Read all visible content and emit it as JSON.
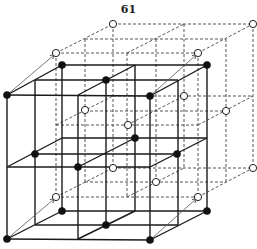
{
  "page": {
    "number": "61"
  },
  "diagram": {
    "colors": {
      "line": "#1a1a1a",
      "dashed": "#444444",
      "filled_atom": "#111111",
      "open_atom": "#ffffff"
    },
    "solid_lines": [
      [
        7,
        95,
        150,
        96
      ],
      [
        7,
        167,
        150,
        167
      ],
      [
        7,
        239,
        150,
        240
      ],
      [
        7,
        95,
        7,
        239
      ],
      [
        78,
        95,
        78,
        239
      ],
      [
        150,
        96,
        150,
        240
      ],
      [
        62,
        65,
        207,
        65
      ],
      [
        62,
        138,
        207,
        138
      ],
      [
        62,
        211,
        207,
        211
      ],
      [
        62,
        65,
        62,
        211
      ],
      [
        135,
        65,
        135,
        211
      ],
      [
        207,
        65,
        207,
        211
      ],
      [
        35,
        80,
        178,
        80
      ],
      [
        35,
        154,
        178,
        154
      ],
      [
        35,
        225,
        178,
        225
      ],
      [
        35,
        80,
        35,
        225
      ],
      [
        106,
        80,
        106,
        225
      ],
      [
        178,
        80,
        178,
        225
      ],
      [
        7,
        95,
        62,
        65
      ],
      [
        78,
        95,
        135,
        65
      ],
      [
        150,
        96,
        207,
        65
      ],
      [
        7,
        167,
        62,
        138
      ],
      [
        78,
        167,
        135,
        138
      ],
      [
        150,
        167,
        207,
        138
      ],
      [
        7,
        239,
        62,
        211
      ],
      [
        78,
        239,
        135,
        211
      ],
      [
        150,
        240,
        207,
        211
      ]
    ],
    "dashed_lines": [
      [
        56,
        53,
        198,
        53
      ],
      [
        56,
        125,
        198,
        125
      ],
      [
        56,
        197,
        198,
        197
      ],
      [
        56,
        53,
        56,
        197
      ],
      [
        127,
        53,
        127,
        197
      ],
      [
        198,
        53,
        198,
        197
      ],
      [
        113,
        24,
        253,
        24
      ],
      [
        113,
        96,
        253,
        96
      ],
      [
        113,
        168,
        253,
        168
      ],
      [
        113,
        24,
        113,
        168
      ],
      [
        184,
        24,
        184,
        168
      ],
      [
        253,
        24,
        253,
        168
      ],
      [
        85,
        39,
        226,
        39
      ],
      [
        85,
        111,
        226,
        111
      ],
      [
        85,
        182,
        226,
        182
      ],
      [
        85,
        39,
        85,
        182
      ],
      [
        156,
        39,
        156,
        182
      ],
      [
        226,
        39,
        226,
        182
      ],
      [
        56,
        53,
        113,
        24
      ],
      [
        127,
        53,
        184,
        24
      ],
      [
        198,
        53,
        253,
        24
      ],
      [
        56,
        125,
        113,
        96
      ],
      [
        127,
        125,
        184,
        96
      ],
      [
        198,
        125,
        253,
        96
      ],
      [
        56,
        197,
        113,
        168
      ],
      [
        127,
        197,
        184,
        168
      ],
      [
        198,
        197,
        253,
        168
      ]
    ],
    "arrows": [
      [
        7,
        95,
        54,
        55
      ],
      [
        150,
        96,
        196,
        55
      ],
      [
        7,
        239,
        54,
        199
      ],
      [
        150,
        240,
        196,
        199
      ]
    ],
    "filled_atoms": [
      [
        7,
        95
      ],
      [
        62,
        65
      ],
      [
        150,
        96
      ],
      [
        207,
        65
      ],
      [
        106,
        80
      ],
      [
        35,
        154
      ],
      [
        78,
        167
      ],
      [
        135,
        138
      ],
      [
        177,
        154
      ],
      [
        62,
        211
      ],
      [
        106,
        225
      ],
      [
        7,
        239
      ],
      [
        150,
        240
      ],
      [
        207,
        211
      ]
    ],
    "open_atoms": [
      [
        56,
        53
      ],
      [
        113,
        24
      ],
      [
        198,
        53
      ],
      [
        253,
        24
      ],
      [
        85,
        110
      ],
      [
        128,
        125
      ],
      [
        184,
        96
      ],
      [
        226,
        111
      ],
      [
        113,
        168
      ],
      [
        156,
        182
      ],
      [
        56,
        197
      ],
      [
        198,
        197
      ],
      [
        253,
        168
      ]
    ]
  }
}
